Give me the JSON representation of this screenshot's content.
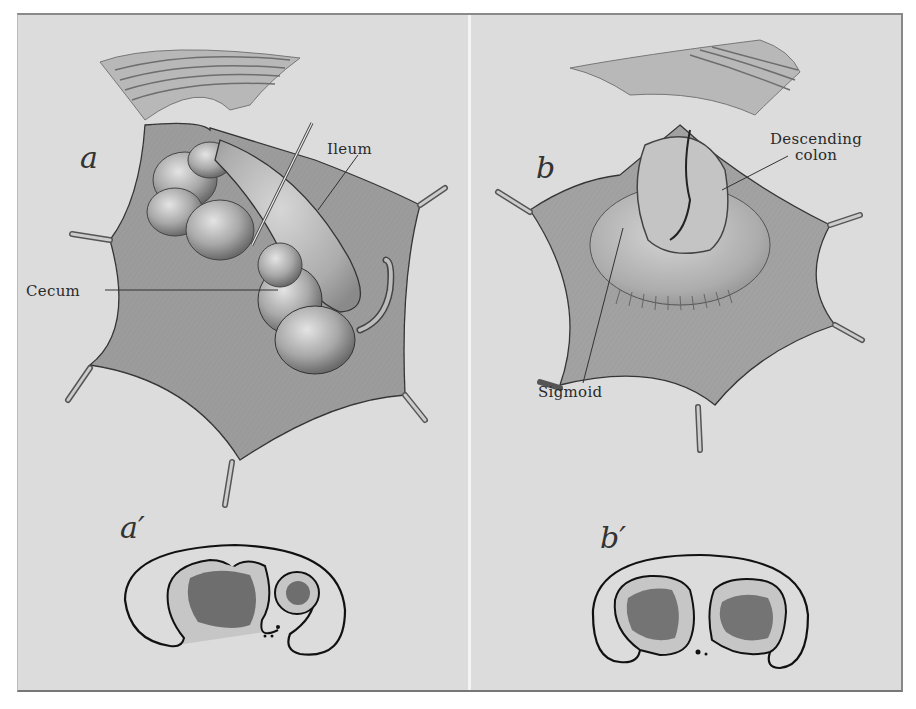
{
  "figure": {
    "panels": [
      {
        "id": "a",
        "letter": "a",
        "labels": {
          "ileum": "Ileum",
          "cecum": "Cecum"
        }
      },
      {
        "id": "b",
        "letter": "b",
        "labels": {
          "descending_colon_line1": "Descending",
          "descending_colon_line2": "colon",
          "sigmoid": "Sigmoid"
        }
      }
    ],
    "cross_sections": [
      {
        "id": "a-prime",
        "letter": "a′"
      },
      {
        "id": "b-prime",
        "letter": "b′"
      }
    ],
    "colors": {
      "paper": "#dcdcdc",
      "tissue": "#9a9a9a",
      "tissue_dark": "#6e6e6e",
      "bowel": "#b5b5b5",
      "lumen": "#707070",
      "ink": "#1e1e1e"
    }
  }
}
